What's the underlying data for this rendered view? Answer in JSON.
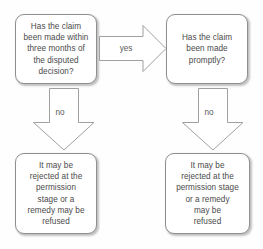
{
  "diagram": {
    "background_color": "#fefefe",
    "box_border_color": "#8f8f8f",
    "arrow_border_color": "#a0a0a0",
    "text_color": "#4a4a4a"
  },
  "nodes": {
    "question_1": {
      "id": "node-q1",
      "shape": "rounded-rectangle",
      "text": "Has the claim\nbeen made within\nthree months of\nthe disputed\ndecision?"
    },
    "question_2": {
      "id": "node-q2",
      "shape": "rounded-rectangle",
      "text": "Has the claim\nbeen made\npromptly?"
    },
    "outcome_1": {
      "id": "node-o1",
      "shape": "rounded-rectangle",
      "text": "It may be\nrejected at the\npermission\nstage or a\nremedy may be\nrefused"
    },
    "outcome_2": {
      "id": "node-o2",
      "shape": "rounded-rectangle",
      "text": "It may be\nrejected at the\npermission stage\nor a remedy\nmay be\nrefused"
    }
  },
  "arrows": {
    "yes": {
      "id": "arrow-yes",
      "label": "yes",
      "direction": "right",
      "from": "question_1",
      "to": "question_2"
    },
    "no_left": {
      "id": "arrow-no-left",
      "label": "no",
      "direction": "down",
      "from": "question_1",
      "to": "outcome_1"
    },
    "no_right": {
      "id": "arrow-no-right",
      "label": "no",
      "direction": "down",
      "from": "question_2",
      "to": "outcome_2"
    }
  }
}
